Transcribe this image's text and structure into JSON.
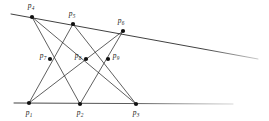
{
  "figure": {
    "width": 269,
    "height": 121,
    "background_color": "#ffffff",
    "stroke_color": "#2b2b2b",
    "point_color": "#111111",
    "label_color": "#1a1a1a"
  },
  "points": [
    {
      "id": "p1",
      "label": "p",
      "sub": "1",
      "x": 29,
      "y": 103,
      "label_x": 29,
      "label_y": 113,
      "r": 2.1
    },
    {
      "id": "p2",
      "label": "p",
      "sub": "2",
      "x": 80,
      "y": 104,
      "label_x": 80,
      "label_y": 113,
      "r": 2.1
    },
    {
      "id": "p3",
      "label": "p",
      "sub": "3",
      "x": 136,
      "y": 104,
      "label_x": 136,
      "label_y": 113,
      "r": 2.1
    },
    {
      "id": "p4",
      "label": "p",
      "sub": "4",
      "x": 32,
      "y": 17,
      "label_x": 31,
      "label_y": 6,
      "r": 2.1
    },
    {
      "id": "p5",
      "label": "p",
      "sub": "5",
      "x": 73,
      "y": 24,
      "label_x": 72,
      "label_y": 14,
      "r": 2.1
    },
    {
      "id": "p6",
      "label": "p",
      "sub": "6",
      "x": 123,
      "y": 31,
      "label_x": 121,
      "label_y": 21,
      "r": 2.1
    },
    {
      "id": "p7",
      "label": "p",
      "sub": "7",
      "x": 50,
      "y": 59,
      "label_x": 43,
      "label_y": 56,
      "r": 2.1
    },
    {
      "id": "p8",
      "label": "p",
      "sub": "8",
      "x": 86,
      "y": 59,
      "label_x": 78,
      "label_y": 56,
      "r": 2.1
    },
    {
      "id": "p9",
      "label": "p",
      "sub": "9",
      "x": 108,
      "y": 59,
      "label_x": 116,
      "label_y": 56,
      "r": 2.1
    }
  ],
  "lines": [
    {
      "id": "line-upper",
      "name": "upper-base-line",
      "x1": 11,
      "y1": 14,
      "x2": 258,
      "y2": 59,
      "width": 0.9,
      "fade": true
    },
    {
      "id": "line-lower",
      "name": "lower-base-line",
      "x1": 14,
      "y1": 103,
      "x2": 233,
      "y2": 104,
      "width": 0.9,
      "fade": true
    },
    {
      "id": "line-p1p5",
      "name": "connector-p1-p5",
      "x1": 29,
      "y1": 103,
      "x2": 73,
      "y2": 24,
      "width": 0.75,
      "fade": false
    },
    {
      "id": "line-p1p6",
      "name": "connector-p1-p6",
      "x1": 29,
      "y1": 103,
      "x2": 123,
      "y2": 31,
      "width": 0.75,
      "fade": false
    },
    {
      "id": "line-p2p4",
      "name": "connector-p2-p4",
      "x1": 80,
      "y1": 104,
      "x2": 32,
      "y2": 17,
      "width": 0.75,
      "fade": false
    },
    {
      "id": "line-p2p6",
      "name": "connector-p2-p6",
      "x1": 80,
      "y1": 104,
      "x2": 123,
      "y2": 31,
      "width": 0.75,
      "fade": false
    },
    {
      "id": "line-p3p4",
      "name": "connector-p3-p4",
      "x1": 136,
      "y1": 104,
      "x2": 32,
      "y2": 17,
      "width": 0.75,
      "fade": false
    },
    {
      "id": "line-p3p5",
      "name": "connector-p3-p5",
      "x1": 136,
      "y1": 104,
      "x2": 73,
      "y2": 24,
      "width": 0.75,
      "fade": false
    }
  ]
}
